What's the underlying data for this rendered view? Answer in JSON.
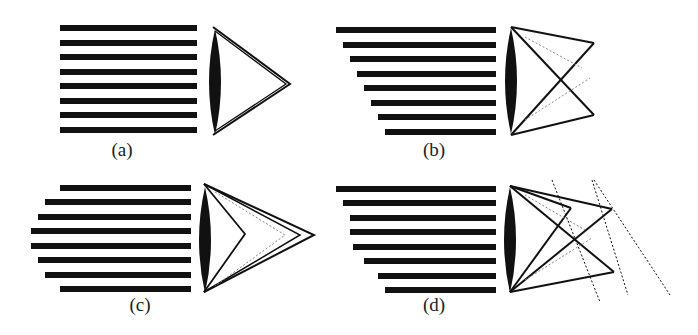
{
  "figure": {
    "panels": [
      {
        "id": "a",
        "label": "(a)",
        "description": "Uniform bars, single focus"
      },
      {
        "id": "b",
        "label": "(b)",
        "description": "Staggered bars, crossed rays"
      },
      {
        "id": "c",
        "label": "(c)",
        "description": "Rounded bar profile, multiple nested foci"
      },
      {
        "id": "d",
        "label": "(d)",
        "description": "Staggered bars, crossed rays with tilted focal planes"
      }
    ],
    "colors": {
      "ink": "#111111",
      "gray_ray": "#888888",
      "background": "#ffffff"
    }
  }
}
